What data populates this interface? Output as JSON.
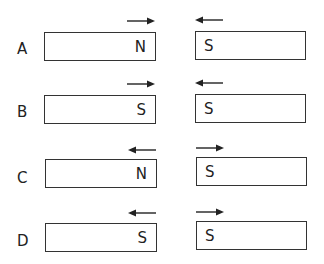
{
  "options": [
    {
      "label": "A",
      "left_pole": "N",
      "right_pole": "S",
      "left_arrow": "right",
      "right_arrow": "left"
    },
    {
      "label": "B",
      "left_pole": "S",
      "right_pole": "S",
      "left_arrow": "right",
      "right_arrow": "left"
    },
    {
      "label": "C",
      "left_pole": "N",
      "right_pole": "S",
      "left_arrow": "left",
      "right_arrow": "right"
    },
    {
      "label": "D",
      "left_pole": "S",
      "right_pole": "S",
      "left_arrow": "left",
      "right_arrow": "right"
    }
  ],
  "colors": {
    "stroke": "#333333",
    "text": "#222222",
    "background": "#ffffff"
  }
}
